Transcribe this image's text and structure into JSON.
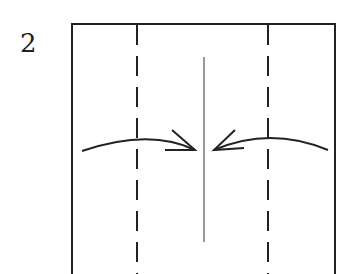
{
  "step": {
    "number": "2"
  },
  "diagram": {
    "colors": {
      "stroke": "#222222",
      "center_line": "#555555",
      "background": "#ffffff"
    },
    "paper": {
      "left": 72,
      "top": 24,
      "right": 335,
      "bottom_extends_beyond": true
    },
    "valley_folds": [
      {
        "x": 137
      },
      {
        "x": 268
      }
    ],
    "center_crease": {
      "x": 204,
      "y1": 57,
      "y2": 242
    },
    "arrows": [
      {
        "name": "left-fold-arrow",
        "direction": "right"
      },
      {
        "name": "right-fold-arrow",
        "direction": "left"
      }
    ]
  }
}
